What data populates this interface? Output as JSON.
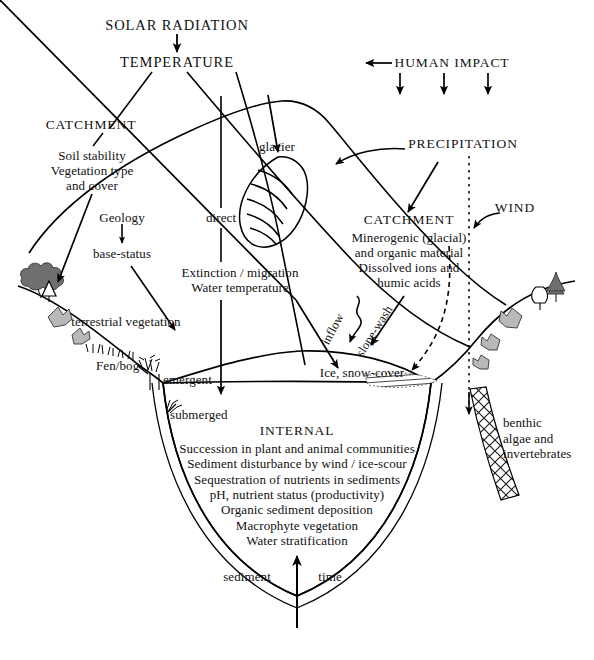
{
  "diagram": {
    "stroke_color": "#000000",
    "background_color": "#ffffff",
    "tree_fill_dark": "#6f6f6f",
    "shrub_fill_gray": "#b9b9b9",
    "labels": {
      "solar_radiation": "SOLAR RADIATION",
      "temperature": "TEMPERATURE",
      "human_impact": "HUMAN IMPACT",
      "precipitation": "PRECIPITATION",
      "wind": "WIND",
      "catchment_left": "CATCHMENT",
      "catchment_left_detail": "Soil stability\nVegetation type\nand cover",
      "geology": "Geology",
      "base_status": "base-status",
      "direct": "direct",
      "extinction_migration": "Extinction / migration\nWater temperature",
      "glacier": "glacier",
      "catchment_right": "CATCHMENT",
      "catchment_right_detail": "Minerogenic (glacial)\nand organic material\nDissolved ions and\nhumic acids",
      "inflow": "inflow",
      "slope_wash": "slope-wash",
      "ice_snow_cover": "Ice, snow-cover",
      "terrestrial_vegetation": "terrestrial vegetation",
      "fen_bog": "Fen/bog",
      "emergent": "emergent",
      "submerged": "submerged",
      "benthic": "benthic\nalgae and\ninvertebrates",
      "internal_heading": "INTERNAL",
      "internal_lines": [
        "Succession in plant and animal communities",
        "Sediment disturbance by wind / ice-scour",
        "Sequestration of nutrients in sediments",
        "pH, nutrient status (productivity)",
        "Organic sediment deposition",
        "Macrophyte vegetation",
        "Water stratification"
      ],
      "internal_block": "Succession in plant and animal communities\nSediment disturbance by wind / ice-scour\nSequestration of nutrients in sediments\npH, nutrient status (productivity)\nOrganic sediment deposition\nMacrophyte vegetation\nWater stratification",
      "sediment": "sediment",
      "time": "time"
    }
  }
}
